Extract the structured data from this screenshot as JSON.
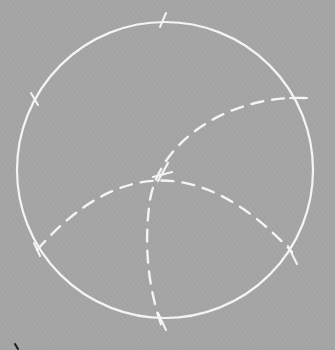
{
  "diagram": {
    "background_color": "#a6a6a6",
    "chalk_color": "#f4f4f4",
    "mark_color": "#1a1a1a",
    "circle": {
      "cx": 165,
      "cy": 170,
      "r": 148
    },
    "ticks": [
      {
        "name": "top",
        "x": 163,
        "y": 21
      },
      {
        "name": "upper-left",
        "x": 35,
        "y": 100
      },
      {
        "name": "lower-left",
        "x": 37,
        "y": 250
      },
      {
        "name": "lower-right",
        "x": 292,
        "y": 252
      },
      {
        "name": "bottom",
        "x": 163,
        "y": 320
      },
      {
        "name": "upper-right",
        "x": 298,
        "y": 98
      }
    ],
    "arcs": [
      {
        "name": "horizontal-dashed-arc",
        "style": "dashed",
        "from": [
          37,
          250
        ],
        "through": [
          160,
          176
        ],
        "to": [
          292,
          252
        ]
      },
      {
        "name": "vertical-dashed-arc",
        "style": "dashed",
        "from": [
          305,
          98
        ],
        "through": [
          160,
          176
        ],
        "to": [
          163,
          330
        ]
      }
    ],
    "intersection": {
      "x": 160,
      "y": 176
    }
  }
}
